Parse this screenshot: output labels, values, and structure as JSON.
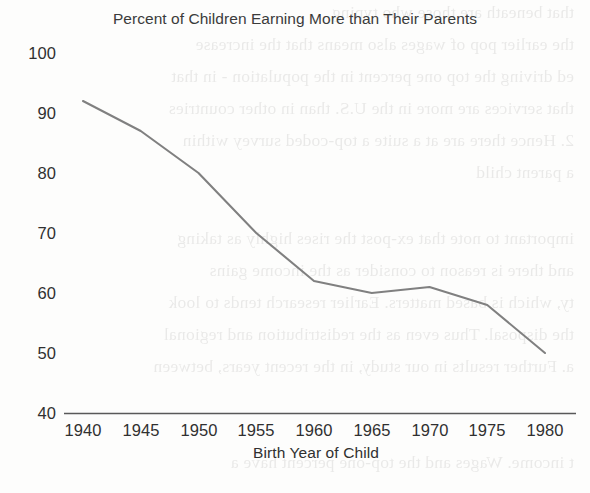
{
  "chart_data": {
    "type": "line",
    "title": "Percent of Children Earning More than Their Parents",
    "xlabel": "Birth Year of Child",
    "ylabel": "",
    "x": [
      1940,
      1945,
      1950,
      1955,
      1960,
      1965,
      1970,
      1975,
      1980
    ],
    "values": [
      92,
      87,
      80,
      70,
      62,
      60,
      61,
      58,
      50
    ],
    "series": [
      {
        "name": "Percent of children earning more than their parents",
        "values": [
          92,
          87,
          80,
          70,
          62,
          60,
          61,
          58,
          50
        ]
      }
    ],
    "xlim": [
      1940,
      1980
    ],
    "ylim": [
      40,
      100
    ],
    "xticks": [
      "1940",
      "1945",
      "1950",
      "1955",
      "1960",
      "1965",
      "1970",
      "1975",
      "1980"
    ],
    "yticks": [
      "100",
      "90",
      "80",
      "70",
      "60",
      "50",
      "40"
    ],
    "grid": false,
    "legend": false,
    "line_color": "#808080",
    "axis_color": "#595959",
    "text_color": "#303030"
  },
  "chart": {
    "title": "Percent of Children Earning More than Their Parents",
    "x_axis_title": "Birth Year of Child",
    "y_ticks": [
      "100",
      "90",
      "80",
      "70",
      "60",
      "50",
      "40"
    ],
    "x_ticks": [
      "1940",
      "1945",
      "1950",
      "1955",
      "1960",
      "1965",
      "1970",
      "1975",
      "1980"
    ]
  },
  "scan_bleed_through": {
    "lines": [
      "that beneath are those who typing",
      "the earlier pop of wages also means that the increase",
      "ed driving the top one percent in the population - in that",
      "that services are more in the U.S. than in other countries",
      "2. Hence there are at a suite a top-coded survey within",
      "a parent child",
      "important to note that ex-post the rises highly as taking",
      "and there is reason to consider as the income gains",
      "ty, which is based matters. Earlier research tends to look",
      "the disposal. Thus even as the redistribution and regional",
      "a. Further results in our study, in the recent years, between",
      "t income. Wages and the top-one percent have a"
    ]
  }
}
